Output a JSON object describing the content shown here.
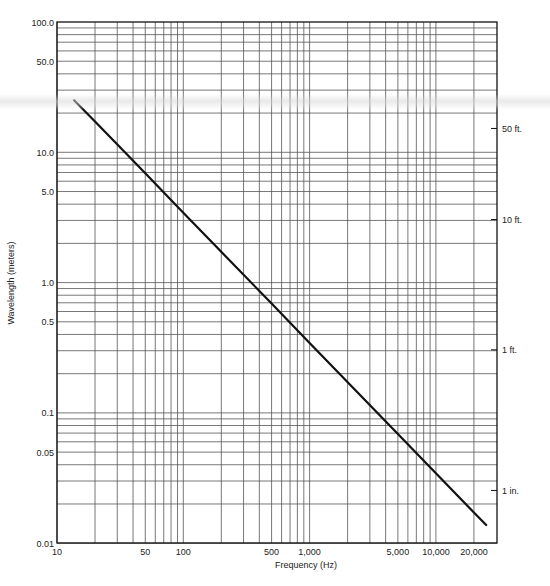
{
  "chart_data": {
    "type": "line",
    "title": "",
    "xlabel": "Frequency (Hz)",
    "ylabel": "Wavelength (meters)",
    "xscale": "log",
    "yscale": "log",
    "xlim": [
      10,
      30000
    ],
    "ylim": [
      0.01,
      100
    ],
    "grid": true,
    "x_ticks": [
      {
        "value": 10,
        "label": "10"
      },
      {
        "value": 50,
        "label": "50"
      },
      {
        "value": 100,
        "label": "100"
      },
      {
        "value": 500,
        "label": "500"
      },
      {
        "value": 1000,
        "label": "1,000"
      },
      {
        "value": 5000,
        "label": "5,000"
      },
      {
        "value": 10000,
        "label": "10,000"
      },
      {
        "value": 20000,
        "label": "20,000"
      }
    ],
    "y_ticks": [
      {
        "value": 100,
        "label": "100.0"
      },
      {
        "value": 50,
        "label": "50.0"
      },
      {
        "value": 10,
        "label": "10.0"
      },
      {
        "value": 5,
        "label": "5.0"
      },
      {
        "value": 1,
        "label": "1.0"
      },
      {
        "value": 0.5,
        "label": "0.5"
      },
      {
        "value": 0.1,
        "label": "0.1"
      },
      {
        "value": 0.05,
        "label": "0.05"
      },
      {
        "value": 0.01,
        "label": "0.01"
      }
    ],
    "secondary_y_ticks": [
      {
        "value": 15.24,
        "label": "50 ft."
      },
      {
        "value": 3.048,
        "label": "10 ft."
      },
      {
        "value": 0.3048,
        "label": "1 ft."
      },
      {
        "value": 0.0254,
        "label": "1 in."
      }
    ],
    "series": [
      {
        "name": "Wavelength vs Frequency",
        "x": [
          13.7,
          20,
          50,
          100,
          500,
          1000,
          5000,
          10000,
          20000,
          25000
        ],
        "y": [
          25,
          17.2,
          6.9,
          3.44,
          0.69,
          0.344,
          0.069,
          0.0344,
          0.0172,
          0.0138
        ]
      }
    ]
  }
}
